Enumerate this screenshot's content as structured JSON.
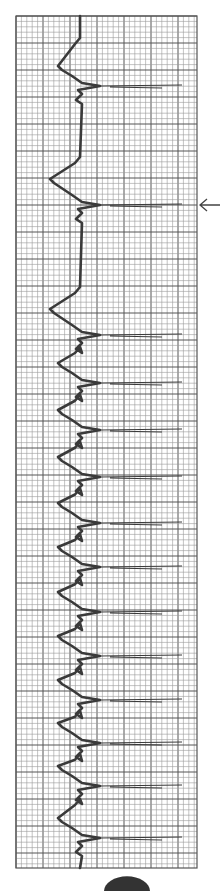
{
  "chart_data": {
    "type": "line",
    "title": "",
    "orientation": "vertical",
    "grid": true,
    "grid_minor_px": 5.4,
    "grid_major_every": 5,
    "grid_bounds": {
      "left": 16,
      "top": 16,
      "right": 197,
      "bottom": 868
    },
    "baseline_x": 80,
    "spike_tip_x": 182,
    "beats_y": [
      86,
      205,
      335,
      383,
      430,
      477,
      523,
      567,
      612,
      656,
      700,
      743,
      786,
      838
    ],
    "annotations": [
      {
        "type": "arrow",
        "label": "",
        "y": 205,
        "direction": "left"
      }
    ],
    "xlabel": "",
    "ylabel": ""
  },
  "colors": {
    "grid_minor": "#9a9a9a",
    "grid_major": "#555555",
    "trace": "#3a3a3a",
    "background": "#ffffff"
  },
  "marker": {
    "label": ""
  }
}
